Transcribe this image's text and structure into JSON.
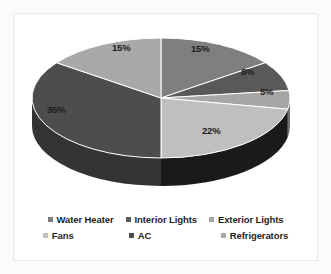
{
  "chart_data": {
    "type": "pie",
    "title": "",
    "subtitle": "",
    "xlabel": "",
    "ylabel": "",
    "legend_position": "bottom",
    "grid": false,
    "three_d": true,
    "start_angle_deg": 0,
    "direction": "clockwise",
    "categories": [
      "Water Heater",
      "Interior Lights",
      "Exterior Lights",
      "Fans",
      "AC",
      "Refrigerators"
    ],
    "values": [
      15,
      8,
      5,
      22,
      35,
      15
    ],
    "data_labels": [
      "15%",
      "8%",
      "5%",
      "22%",
      "35%",
      "15%"
    ],
    "colors": [
      "#7f7f7f",
      "#595959",
      "#a6a6a6",
      "#bfbfbf",
      "#4d4d4d",
      "#a9a9a9"
    ],
    "side_colors": [
      "#565656",
      "#3c3c3c",
      "#6f6f6f",
      "#1a1a1a",
      "#343434",
      "#737373"
    ],
    "units": "percent",
    "total": 100
  },
  "chart": {
    "background_color": "#ffffff",
    "panel_border_color": "#e9e9e9",
    "label_text_color": "#1c1c1c"
  },
  "labels": {
    "water_heater": "15%",
    "interior_lights": "8%",
    "exterior_lights": "5%",
    "fans": "22%",
    "ac": "35%",
    "refrigerators": "15%"
  },
  "legend": {
    "row1": [
      {
        "label": "Water Heater",
        "color": "#7f7f7f"
      },
      {
        "label": "Interior Lights",
        "color": "#595959"
      },
      {
        "label": "Exterior Lights",
        "color": "#a6a6a6"
      }
    ],
    "row2": [
      {
        "label": "Fans",
        "color": "#bfbfbf"
      },
      {
        "label": "AC",
        "color": "#4d4d4d"
      },
      {
        "label": "Refrigerators",
        "color": "#a9a9a9"
      }
    ]
  }
}
